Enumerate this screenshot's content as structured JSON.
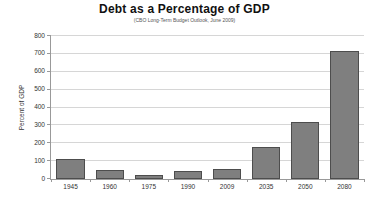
{
  "chart_data": {
    "type": "bar",
    "title": "Debt as a Percentage of GDP",
    "subtitle": "(CBO Long-Term Budget Outlook, June 2009)",
    "ylabel": "Percent of GDP",
    "xlabel": "",
    "categories": [
      "1945",
      "1960",
      "1975",
      "1990",
      "2009",
      "2035",
      "2050",
      "2080"
    ],
    "values": [
      110,
      48,
      25,
      43,
      55,
      180,
      320,
      715
    ],
    "ylim": [
      0,
      800
    ],
    "ytick_step": 100,
    "grid": "horizontal",
    "legend": "none",
    "bar_color": "#7f7f7f",
    "bar_border_color": "#4d4d4d",
    "grid_color": "#d6d6d6",
    "axis_color": "#999999",
    "background_color": "#ffffff"
  }
}
